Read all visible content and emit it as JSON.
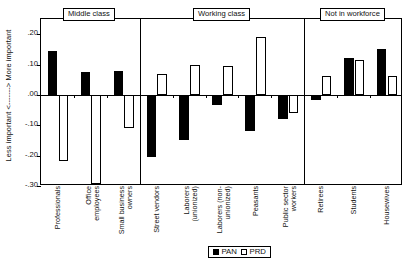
{
  "chart_data": {
    "type": "bar",
    "title": "",
    "xlabel": "",
    "ylabel": "Less important <-------> More important",
    "ylim": [
      -0.3,
      0.25
    ],
    "yticks": [
      0.2,
      0.1,
      0.0,
      -0.1,
      -0.2,
      -0.3
    ],
    "ytick_labels": [
      ".20",
      ".10",
      ".00",
      "-.10",
      "-.20",
      "-.30"
    ],
    "grid": false,
    "legend_position": "bottom-center",
    "categories": [
      "Professionals",
      "Office employees",
      "Small business owners",
      "Street vendors",
      "Laborers (unionized)",
      "Laborers (non-unionized)",
      "Peasants",
      "Public sector workers",
      "Retirees",
      "Students",
      "Housewives"
    ],
    "series": [
      {
        "name": "PAN",
        "color": "#000000",
        "values": [
          0.145,
          0.077,
          0.078,
          -0.205,
          -0.148,
          -0.032,
          -0.118,
          -0.078,
          -0.018,
          0.122,
          0.15
        ]
      },
      {
        "name": "PRD",
        "color": "#ffffff",
        "values": [
          -0.218,
          -0.295,
          -0.108,
          0.068,
          0.1,
          0.095,
          0.192,
          -0.058,
          0.063,
          0.115,
          0.062
        ]
      }
    ],
    "groups": [
      {
        "label": "Middle class",
        "categories": [
          "Professionals",
          "Office employees",
          "Small business owners"
        ]
      },
      {
        "label": "Working class",
        "categories": [
          "Street vendors",
          "Laborers (unionized)",
          "Laborers (non-unionized)",
          "Peasants",
          "Public sector workers"
        ]
      },
      {
        "label": "Not in workforce",
        "categories": [
          "Retirees",
          "Students",
          "Housewives"
        ]
      }
    ]
  },
  "axis": {
    "y_title": "Less important <-------> More important",
    "y_title_prefix": "Less important",
    "y_title_suffix": "More important",
    "ticks": [
      {
        "label": ".20"
      },
      {
        "label": ".10"
      },
      {
        "label": ".00"
      },
      {
        "label": "-.10"
      },
      {
        "label": "-.20"
      },
      {
        "label": "-.30"
      }
    ]
  },
  "groups": [
    {
      "label": "Middle class"
    },
    {
      "label": "Working class"
    },
    {
      "label": "Not in workforce"
    }
  ],
  "x_labels": [
    {
      "line1": "Professionals",
      "line2": ""
    },
    {
      "line1": "Office",
      "line2": "employees"
    },
    {
      "line1": "Small business",
      "line2": "owners"
    },
    {
      "line1": "Street vendors",
      "line2": ""
    },
    {
      "line1": "Laborers",
      "line2": "(unionized)"
    },
    {
      "line1": "Laborers (non-",
      "line2": "unionized)"
    },
    {
      "line1": "Peasants",
      "line2": ""
    },
    {
      "line1": "Public sector",
      "line2": "workers"
    },
    {
      "line1": "Retirees",
      "line2": ""
    },
    {
      "line1": "Students",
      "line2": ""
    },
    {
      "line1": "Housewives",
      "line2": ""
    }
  ],
  "legend": {
    "items": [
      {
        "label": "PAN",
        "style": "pan"
      },
      {
        "label": "PRD",
        "style": "prd"
      }
    ]
  }
}
